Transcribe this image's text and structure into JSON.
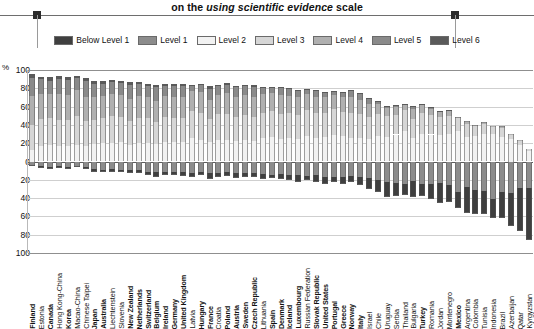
{
  "title": {
    "line": "on the using scientific evidence scale",
    "prefix": "on the ",
    "italic": "using scientific evidence",
    "suffix": " scale"
  },
  "legend": {
    "position": "top-center",
    "items": [
      {
        "label": "Below Level 1",
        "color": "#3f3f3f"
      },
      {
        "label": "Level 1",
        "color": "#8c8c8c"
      },
      {
        "label": "Level 2",
        "color": "#f2f2f2"
      },
      {
        "label": "Level 3",
        "color": "#d6d6d6"
      },
      {
        "label": "Level 4",
        "color": "#b0b0b0"
      },
      {
        "label": "Level 5",
        "color": "#8a8a8a"
      },
      {
        "label": "Level 6",
        "color": "#5a5a5a"
      }
    ]
  },
  "axis": {
    "unit": "%",
    "y_ticks": [
      "100",
      "80",
      "60",
      "40",
      "20",
      "0",
      "20",
      "40",
      "60",
      "80",
      "100"
    ],
    "y_values": [
      100,
      80,
      60,
      40,
      20,
      0,
      -20,
      -40,
      -60,
      -80,
      -100
    ],
    "ylim": [
      -100,
      100
    ],
    "grid": true
  },
  "chart_data": {
    "type": "bar",
    "subtype": "diverging-stacked-bar",
    "title": "on the using scientific evidence scale",
    "xlabel": "",
    "ylabel": "%",
    "ylim": [
      -100,
      100
    ],
    "grid": true,
    "legend_position": "top-center",
    "note": "Percentages below the zero line show students at Level 1 and Below Level 1; percentages above show Levels 2 to 6.",
    "categories": [
      "Finland",
      "Estonia",
      "Canada",
      "Hong Kong-China",
      "Korea",
      "Macao-China",
      "Chinese Taipei",
      "Japan",
      "Australia",
      "Liechtenstein",
      "Slovenia",
      "New Zealand",
      "Netherlands",
      "Switzerland",
      "Belgium",
      "Ireland",
      "Germany",
      "United Kingdom",
      "Latvia",
      "Hungary",
      "France",
      "Croatia",
      "Poland",
      "Austria",
      "Sweden",
      "Czech Republic",
      "Lithuania",
      "Spain",
      "Denmark",
      "Iceland",
      "Luxembourg",
      "Russian Federation",
      "Slovak Republic",
      "United States",
      "Portugal",
      "Greece",
      "Norway",
      "Italy",
      "Israel",
      "Chile",
      "Uruguay",
      "Serbia",
      "Thailand",
      "Bulgaria",
      "Turkey",
      "Romania",
      "Jordan",
      "Montenegro",
      "Mexico",
      "Argentina",
      "Colombia",
      "Tunisia",
      "Indonesia",
      "Brazil",
      "Azerbaijan",
      "Qatar",
      "Kyrgyzstan"
    ],
    "bold_categories": [
      "Finland",
      "Canada",
      "Korea",
      "Japan",
      "Australia",
      "New Zealand",
      "Netherlands",
      "Switzerland",
      "Belgium",
      "Ireland",
      "Germany",
      "United Kingdom",
      "Hungary",
      "France",
      "Poland",
      "Austria",
      "Sweden",
      "Czech Republic",
      "Spain",
      "Denmark",
      "Iceland",
      "Luxembourg",
      "Slovak Republic",
      "United States",
      "Portugal",
      "Greece",
      "Norway",
      "Italy",
      "Turkey",
      "Mexico"
    ],
    "series": [
      {
        "name": "Below Level 1",
        "color": "#3f3f3f",
        "direction": "down",
        "values": [
          1.3,
          2.0,
          2.2,
          1.6,
          2.2,
          1.1,
          2.4,
          3.9,
          3.0,
          2.6,
          2.6,
          4.0,
          3.3,
          4.1,
          5.6,
          3.7,
          4.1,
          4.3,
          4.1,
          3.4,
          6.6,
          4.4,
          3.5,
          5.1,
          3.8,
          4.6,
          5.2,
          4.2,
          5.2,
          5.7,
          7.4,
          5.2,
          7.3,
          8.0,
          5.6,
          7.2,
          6.1,
          9.5,
          12.1,
          13.2,
          17.0,
          14.6,
          11.9,
          18.2,
          12.9,
          16.0,
          21.5,
          18.5,
          18.2,
          28.3,
          26.7,
          24.7,
          20.3,
          28.0,
          36.0,
          47.0,
          57.0
        ]
      },
      {
        "name": "Level 1",
        "color": "#8c8c8c",
        "direction": "down",
        "values": [
          3.3,
          5.0,
          6.0,
          5.0,
          5.6,
          5.3,
          6.0,
          8.0,
          9.0,
          8.5,
          9.2,
          9.0,
          9.5,
          11.0,
          11.0,
          11.5,
          11.0,
          11.5,
          12.6,
          11.5,
          12.4,
          12.8,
          12.0,
          12.5,
          12.8,
          12.5,
          13.5,
          14.3,
          13.8,
          14.5,
          15.0,
          15.5,
          15.3,
          16.5,
          17.2,
          17.0,
          16.2,
          16.5,
          18.0,
          20.5,
          22.0,
          23.5,
          25.0,
          21.0,
          24.5,
          25.0,
          23.5,
          25.5,
          33.0,
          28.0,
          31.0,
          32.5,
          41.0,
          33.5,
          34.0,
          29.0,
          29.0
        ]
      },
      {
        "name": "Level 2",
        "color": "#f2f2f2",
        "direction": "up",
        "values": [
          12.5,
          17.0,
          18.0,
          16.5,
          17.0,
          18.5,
          16.5,
          19.0,
          20.0,
          20.5,
          21.0,
          18.5,
          20.5,
          20.5,
          19.0,
          21.5,
          21.0,
          21.0,
          25.5,
          24.0,
          21.0,
          24.0,
          23.5,
          22.0,
          23.5,
          22.5,
          25.5,
          27.0,
          24.5,
          25.5,
          24.5,
          27.5,
          25.5,
          26.5,
          29.0,
          27.5,
          26.0,
          26.0,
          24.5,
          28.0,
          27.0,
          29.5,
          33.0,
          26.0,
          30.0,
          29.5,
          28.5,
          30.5,
          33.5,
          26.5,
          28.0,
          30.0,
          30.0,
          27.0,
          25.0,
          18.0,
          12.0
        ]
      },
      {
        "name": "Level 3",
        "color": "#d6d6d6",
        "direction": "up",
        "values": [
          27.0,
          29.5,
          29.0,
          29.0,
          28.0,
          31.0,
          27.5,
          26.5,
          27.5,
          29.0,
          27.5,
          25.5,
          27.0,
          26.5,
          24.5,
          27.0,
          26.5,
          26.0,
          30.0,
          29.0,
          25.0,
          27.5,
          28.5,
          26.5,
          27.0,
          26.5,
          28.0,
          28.0,
          27.0,
          27.0,
          26.5,
          28.5,
          27.0,
          26.5,
          28.5,
          27.0,
          26.5,
          25.5,
          24.0,
          24.0,
          22.5,
          21.0,
          23.5,
          20.5,
          23.0,
          21.0,
          20.0,
          19.5,
          13.5,
          14.0,
          10.5,
          11.0,
          7.5,
          10.0,
          4.8,
          5.3,
          2.0
        ]
      },
      {
        "name": "Level 4",
        "color": "#b0b0b0",
        "direction": "up",
        "values": [
          32.0,
          27.5,
          26.5,
          28.5,
          27.5,
          28.5,
          26.5,
          24.5,
          24.5,
          24.5,
          24.5,
          24.5,
          24.0,
          23.0,
          23.0,
          23.0,
          23.5,
          23.0,
          22.0,
          22.5,
          21.5,
          21.5,
          22.5,
          22.5,
          22.0,
          22.0,
          20.5,
          19.5,
          21.5,
          19.5,
          19.0,
          18.0,
          18.5,
          17.0,
          15.5,
          16.0,
          18.0,
          16.0,
          14.5,
          11.0,
          9.0,
          9.0,
          6.0,
          10.5,
          8.5,
          7.5,
          5.5,
          5.5,
          1.8,
          3.0,
          1.8,
          1.8,
          1.2,
          1.5,
          0.2,
          0.7,
          0.0
        ]
      },
      {
        "name": "Level 5",
        "color": "#8a8a8a",
        "direction": "up",
        "values": [
          19.5,
          16.0,
          15.0,
          16.0,
          16.5,
          13.5,
          17.0,
          14.5,
          13.0,
          12.5,
          13.0,
          15.5,
          13.0,
          12.5,
          14.5,
          11.0,
          11.5,
          12.0,
          5.5,
          8.5,
          11.5,
          9.0,
          9.5,
          10.0,
          9.5,
          10.5,
          6.5,
          6.5,
          7.0,
          7.0,
          7.0,
          5.0,
          6.0,
          5.0,
          4.0,
          4.8,
          6.5,
          6.0,
          6.0,
          3.0,
          2.3,
          2.2,
          0.6,
          3.5,
          1.1,
          1.0,
          0.9,
          0.5,
          0.1,
          0.3,
          0.1,
          0.1,
          0.0,
          0.1,
          0.0,
          0.0,
          0.0
        ]
      },
      {
        "name": "Level 6",
        "color": "#5a5a5a",
        "direction": "up",
        "values": [
          4.5,
          2.5,
          3.5,
          3.5,
          3.2,
          2.0,
          4.0,
          3.5,
          3.5,
          2.5,
          2.2,
          2.5,
          2.7,
          2.5,
          2.4,
          2.3,
          2.0,
          2.2,
          0.8,
          1.1,
          3.0,
          1.3,
          1.5,
          1.9,
          1.7,
          1.9,
          0.9,
          0.8,
          1.0,
          1.0,
          0.9,
          0.6,
          0.9,
          0.8,
          0.4,
          0.6,
          1.2,
          0.9,
          0.9,
          0.3,
          0.2,
          0.2,
          0.1,
          0.4,
          0.1,
          0.1,
          0.1,
          0.1,
          0.0,
          0.0,
          0.0,
          0.0,
          0.0,
          0.0,
          0.0,
          0.0,
          0.0
        ]
      }
    ]
  }
}
